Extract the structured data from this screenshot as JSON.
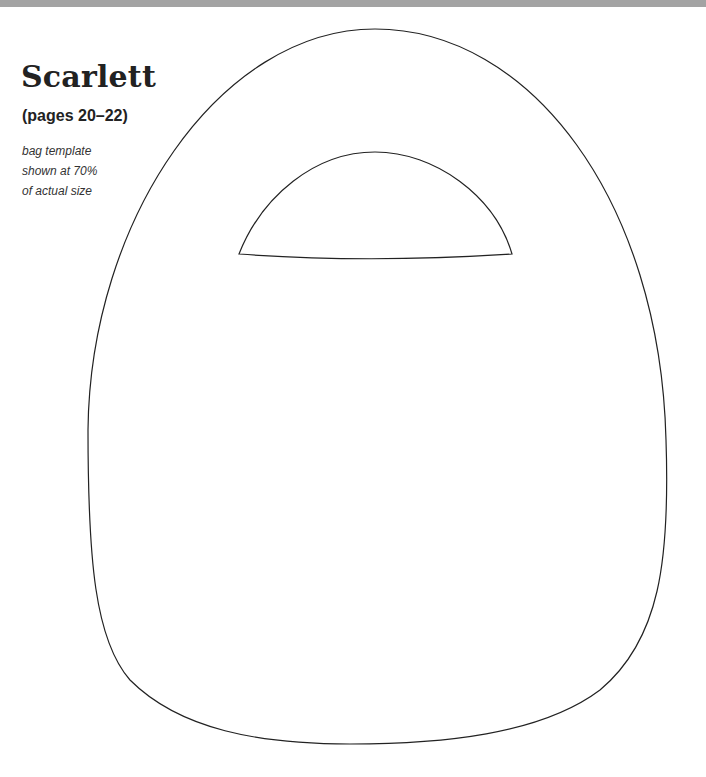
{
  "header": {
    "title": "Scarlett",
    "subtitle": "(pages 20–22)"
  },
  "note": {
    "lines": [
      "bag template",
      "shown at 70%",
      "of actual size"
    ]
  },
  "template": {
    "stroke_color": "#222222",
    "band_color": "#a3a3a3"
  }
}
